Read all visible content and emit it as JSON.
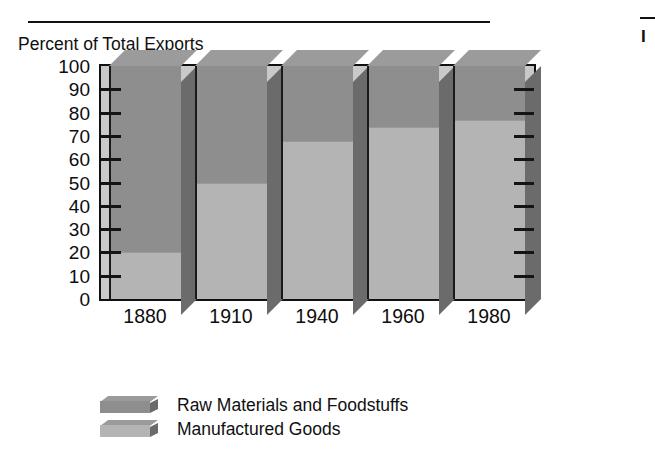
{
  "figure": {
    "axis_title": "Percent of Total Exports",
    "right_fragment": "I"
  },
  "chart_data": {
    "type": "bar",
    "title": "Percent of Total Exports",
    "subtype": "stacked-3d-column",
    "xlabel": "",
    "ylabel": "Percent of Total Exports",
    "ylim": [
      0,
      100
    ],
    "ytick_step": 10,
    "yticks": [
      "100",
      "90",
      "80",
      "70",
      "60",
      "50",
      "40",
      "30",
      "20",
      "10",
      "0"
    ],
    "ytick_values": [
      100,
      90,
      80,
      70,
      60,
      50,
      40,
      30,
      20,
      10,
      0
    ],
    "grid": false,
    "categories": [
      "1880",
      "1910",
      "1940",
      "1960",
      "1980"
    ],
    "legend_position": "bottom-left",
    "series": [
      {
        "name": "Raw Materials and Foodstuffs",
        "color": "#8e8e8e",
        "values": [
          80,
          50,
          32,
          26,
          23
        ]
      },
      {
        "name": "Manufactured Goods",
        "color": "#b4b4b4",
        "values": [
          20,
          50,
          68,
          74,
          77
        ]
      }
    ]
  },
  "legend": {
    "items": [
      {
        "label": "Raw Materials and Foodstuffs",
        "color": "#8e8e8e"
      },
      {
        "label": "Manufactured Goods",
        "color": "#b4b4b4"
      }
    ]
  },
  "colors": {
    "bar_front_raw": "#8e8e8e",
    "bar_front_mfg": "#b4b4b4",
    "bar_side": "#6b6b6b",
    "bar_top": "#9b9b9b",
    "plot_background": "#c9c9c9",
    "axis_line": "#111111",
    "text": "#0d0d0d",
    "page_background": "#ffffff"
  }
}
